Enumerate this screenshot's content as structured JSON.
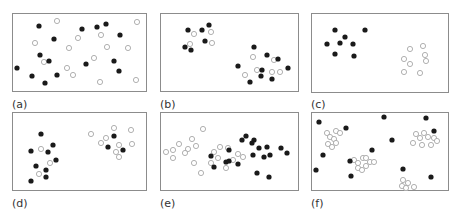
{
  "figure": {
    "style": {
      "frame_color": "#8c8c8c",
      "filled_color": "#1a1a1a",
      "open_stroke": "#a8a8a8",
      "open_fill": "#ffffff",
      "radius": 2.6
    },
    "panels": [
      {
        "label": "(a)",
        "frame": [
          12,
          13,
          134,
          78
        ],
        "label_pos": [
          12,
          98
        ],
        "filled": [
          [
            39,
            26
          ],
          [
            54,
            39
          ],
          [
            82,
            29
          ],
          [
            97,
            27
          ],
          [
            106,
            24
          ],
          [
            120,
            35
          ],
          [
            40,
            55
          ],
          [
            49,
            61
          ],
          [
            17,
            68
          ],
          [
            32,
            76
          ],
          [
            45,
            83
          ],
          [
            57,
            75
          ],
          [
            86,
            64
          ],
          [
            114,
            61
          ],
          [
            119,
            71
          ]
        ],
        "open": [
          [
            57,
            21
          ],
          [
            137,
            22
          ],
          [
            35,
            43
          ],
          [
            69,
            48
          ],
          [
            78,
            38
          ],
          [
            101,
            35
          ],
          [
            107,
            47
          ],
          [
            128,
            48
          ],
          [
            44,
            62
          ],
          [
            67,
            68
          ],
          [
            94,
            58
          ],
          [
            73,
            75
          ],
          [
            100,
            82
          ],
          [
            136,
            80
          ]
        ]
      },
      {
        "label": "(b)",
        "frame": [
          160,
          13,
          138,
          78
        ],
        "label_pos": [
          160,
          98
        ],
        "filled": [
          [
            188,
            30
          ],
          [
            202,
            30
          ],
          [
            209,
            25
          ],
          [
            205,
            41
          ],
          [
            185,
            47
          ],
          [
            191,
            50
          ],
          [
            254,
            47
          ],
          [
            238,
            66
          ],
          [
            267,
            55
          ],
          [
            262,
            70
          ],
          [
            278,
            59
          ],
          [
            288,
            68
          ],
          [
            261,
            76
          ],
          [
            250,
            82
          ],
          [
            272,
            79
          ]
        ],
        "open": [
          [
            194,
            34
          ],
          [
            211,
            32
          ],
          [
            190,
            44
          ],
          [
            212,
            43
          ],
          [
            253,
            57
          ],
          [
            274,
            60
          ],
          [
            257,
            70
          ],
          [
            245,
            75
          ],
          [
            272,
            72
          ],
          [
            280,
            72
          ]
        ]
      },
      {
        "label": "(c)",
        "frame": [
          311,
          13,
          137,
          79
        ],
        "label_pos": [
          311,
          98
        ],
        "filled": [
          [
            335,
            30
          ],
          [
            345,
            37
          ],
          [
            365,
            30
          ],
          [
            327,
            44
          ],
          [
            340,
            43
          ],
          [
            353,
            44
          ],
          [
            335,
            54
          ],
          [
            354,
            56
          ]
        ],
        "open": [
          [
            410,
            49
          ],
          [
            423,
            46
          ],
          [
            425,
            55
          ],
          [
            426,
            61
          ],
          [
            404,
            59
          ],
          [
            410,
            64
          ],
          [
            404,
            72
          ],
          [
            420,
            73
          ]
        ]
      },
      {
        "label": "(d)",
        "frame": [
          12,
          112,
          134,
          78
        ],
        "label_pos": [
          12,
          197
        ],
        "filled": [
          [
            41,
            134
          ],
          [
            53,
            145
          ],
          [
            31,
            151
          ],
          [
            48,
            152
          ],
          [
            56,
            160
          ],
          [
            36,
            166
          ],
          [
            46,
            170
          ],
          [
            46,
            177
          ],
          [
            31,
            181
          ],
          [
            114,
            136
          ],
          [
            108,
            147
          ],
          [
            123,
            150
          ]
        ],
        "open": [
          [
            41,
            149
          ],
          [
            50,
            163
          ],
          [
            39,
            174
          ],
          [
            91,
            134
          ],
          [
            114,
            128
          ],
          [
            131,
            130
          ],
          [
            101,
            143
          ],
          [
            106,
            138
          ],
          [
            119,
            145
          ],
          [
            132,
            144
          ],
          [
            116,
            152
          ],
          [
            119,
            157
          ]
        ]
      },
      {
        "label": "(e)",
        "frame": [
          160,
          112,
          138,
          78
        ],
        "label_pos": [
          160,
          197
        ],
        "filled": [
          [
            211,
            156
          ],
          [
            214,
            167
          ],
          [
            226,
            162
          ],
          [
            229,
            150
          ],
          [
            238,
            164
          ],
          [
            242,
            140
          ],
          [
            246,
            136
          ],
          [
            254,
            140
          ],
          [
            252,
            143
          ],
          [
            259,
            148
          ],
          [
            253,
            155
          ],
          [
            267,
            147
          ],
          [
            270,
            155
          ],
          [
            264,
            157
          ],
          [
            281,
            148
          ],
          [
            287,
            153
          ],
          [
            257,
            173
          ],
          [
            269,
            177
          ],
          [
            229,
            161
          ]
        ],
        "open": [
          [
            203,
            129
          ],
          [
            192,
            139
          ],
          [
            179,
            144
          ],
          [
            173,
            150
          ],
          [
            188,
            149
          ],
          [
            185,
            153
          ],
          [
            196,
            146
          ],
          [
            166,
            152
          ],
          [
            173,
            158
          ],
          [
            194,
            163
          ],
          [
            201,
            173
          ],
          [
            220,
            147
          ],
          [
            214,
            152
          ],
          [
            218,
            158
          ],
          [
            211,
            163
          ],
          [
            233,
            160
          ],
          [
            228,
            148
          ],
          [
            243,
            157
          ],
          [
            226,
            168
          ],
          [
            238,
            154
          ]
        ]
      },
      {
        "label": "(f)",
        "frame": [
          311,
          112,
          137,
          78
        ],
        "label_pos": [
          311,
          197
        ],
        "filled": [
          [
            319,
            122
          ],
          [
            346,
            128
          ],
          [
            323,
            155
          ],
          [
            316,
            170
          ],
          [
            350,
            161
          ],
          [
            372,
            150
          ],
          [
            351,
            176
          ],
          [
            384,
            117
          ],
          [
            392,
            140
          ],
          [
            426,
            118
          ],
          [
            434,
            131
          ],
          [
            403,
            169
          ],
          [
            431,
            177
          ]
        ],
        "open": [
          [
            327,
            133
          ],
          [
            330,
            137
          ],
          [
            336,
            131
          ],
          [
            334,
            139
          ],
          [
            340,
            133
          ],
          [
            336,
            143
          ],
          [
            328,
            144
          ],
          [
            332,
            147
          ],
          [
            354,
            160
          ],
          [
            358,
            163
          ],
          [
            363,
            158
          ],
          [
            370,
            162
          ],
          [
            358,
            168
          ],
          [
            362,
            170
          ],
          [
            366,
            166
          ],
          [
            374,
            162
          ],
          [
            366,
            158
          ],
          [
            416,
            134
          ],
          [
            424,
            133
          ],
          [
            420,
            138
          ],
          [
            428,
            137
          ],
          [
            434,
            138
          ],
          [
            413,
            143
          ],
          [
            422,
            145
          ],
          [
            431,
            145
          ],
          [
            437,
            141
          ],
          [
            403,
            180
          ],
          [
            408,
            183
          ],
          [
            402,
            186
          ],
          [
            406,
            188
          ],
          [
            414,
            187
          ]
        ]
      }
    ]
  }
}
